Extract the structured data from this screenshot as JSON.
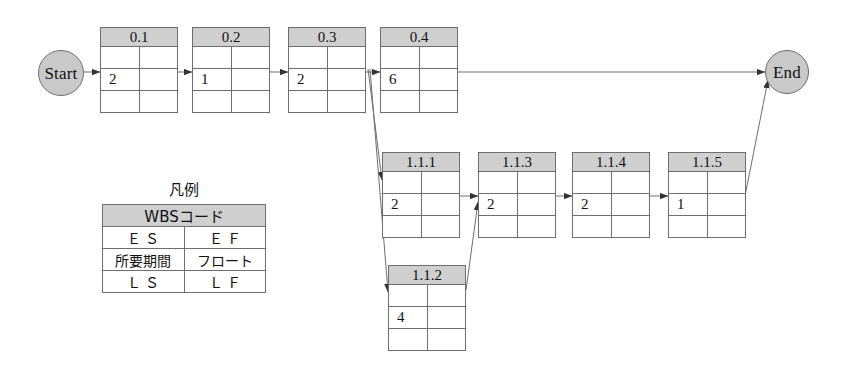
{
  "diagram": {
    "type": "precedence-network-diagram",
    "start_node": {
      "label": "Start"
    },
    "end_node": {
      "label": "End"
    },
    "tasks": [
      {
        "id": "t0_1",
        "code": "0.1",
        "es": "",
        "ef": "",
        "duration": "2",
        "float": "",
        "ls": "",
        "lf": ""
      },
      {
        "id": "t0_2",
        "code": "0.2",
        "es": "",
        "ef": "",
        "duration": "1",
        "float": "",
        "ls": "",
        "lf": ""
      },
      {
        "id": "t0_3",
        "code": "0.3",
        "es": "",
        "ef": "",
        "duration": "2",
        "float": "",
        "ls": "",
        "lf": ""
      },
      {
        "id": "t0_4",
        "code": "0.4",
        "es": "",
        "ef": "",
        "duration": "6",
        "float": "",
        "ls": "",
        "lf": ""
      },
      {
        "id": "t1_1_1",
        "code": "1.1.1",
        "es": "",
        "ef": "",
        "duration": "2",
        "float": "",
        "ls": "",
        "lf": ""
      },
      {
        "id": "t1_1_3",
        "code": "1.1.3",
        "es": "",
        "ef": "",
        "duration": "2",
        "float": "",
        "ls": "",
        "lf": ""
      },
      {
        "id": "t1_1_4",
        "code": "1.1.4",
        "es": "",
        "ef": "",
        "duration": "2",
        "float": "",
        "ls": "",
        "lf": ""
      },
      {
        "id": "t1_1_5",
        "code": "1.1.5",
        "es": "",
        "ef": "",
        "duration": "1",
        "float": "",
        "ls": "",
        "lf": ""
      },
      {
        "id": "t1_1_2",
        "code": "1.1.2",
        "es": "",
        "ef": "",
        "duration": "4",
        "float": "",
        "ls": "",
        "lf": ""
      }
    ]
  },
  "legend": {
    "title": "凡例",
    "header": "WBSコード",
    "es": "Ｅ Ｓ",
    "ef": "Ｅ Ｆ",
    "duration": "所要期間",
    "float": "フロート",
    "ls": "Ｌ Ｓ",
    "lf": "Ｌ Ｆ"
  },
  "colors": {
    "header_fill": "#cfcfcf",
    "node_fill": "#c9c9c9",
    "line": "#6e6e6e",
    "text": "#111111",
    "background": "#ffffff"
  }
}
